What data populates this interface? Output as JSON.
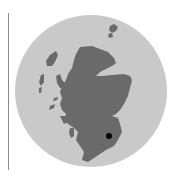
{
  "map": {
    "region": "Scotland",
    "type": "locator-map",
    "colors": {
      "background": "#ffffff",
      "circle": "#c9c9c9",
      "land": "#6a6a6a",
      "marker": "#000000",
      "rule": "#8a8a8a"
    },
    "marker": {
      "x": 109,
      "y": 136,
      "r": 3
    }
  }
}
